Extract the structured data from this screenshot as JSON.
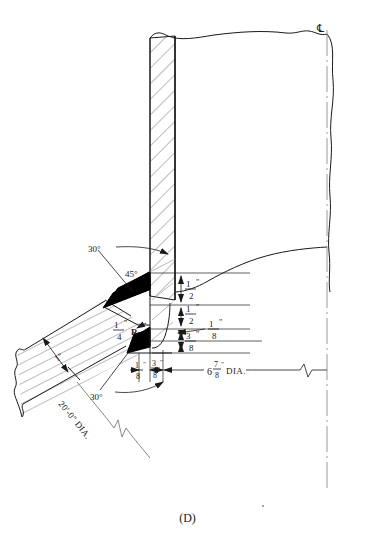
{
  "figure": {
    "caption": "(D)",
    "background_color": "#ffffff",
    "line_color": "#1a1a1a",
    "fill_color": "#000000",
    "hatch_color": "#555555"
  },
  "centerline": {
    "symbol": "℄",
    "label": "centerline-symbol"
  },
  "dimensions": {
    "vertical_right": [
      {
        "id": "half-inch-upper",
        "whole": "",
        "num": "1",
        "den": "2",
        "unit": "\""
      },
      {
        "id": "half-inch-lower",
        "whole": "",
        "num": "1",
        "den": "2",
        "unit": "\""
      },
      {
        "id": "eighth-inch",
        "whole": "",
        "num": "1",
        "den": "8",
        "unit": "\""
      },
      {
        "id": "three-eighths-inch",
        "whole": "",
        "num": "3",
        "den": "8",
        "unit": "\""
      }
    ],
    "bottom_small": [
      {
        "id": "bottom-eighth",
        "whole": "",
        "num": "1",
        "den": "8",
        "unit": "\""
      },
      {
        "id": "bottom-three-eighths",
        "whole": "",
        "num": "3",
        "den": "8",
        "unit": "\""
      }
    ],
    "bore_diameter": {
      "whole": "6",
      "num": "7",
      "den": "8",
      "unit": "\"",
      "suffix": "DIA."
    },
    "shell_diameter": {
      "text": "20'-0\" DIA."
    },
    "flange_thickness": {
      "whole": "",
      "num": "1",
      "den": "",
      "unit": "\"",
      "text": "1\""
    },
    "radius": {
      "num": "1",
      "den": "4",
      "unit": "\"",
      "suffix": "R"
    }
  },
  "angles": {
    "upper_30": "30°",
    "bevel_45": "45°",
    "lower_30": "30°"
  }
}
